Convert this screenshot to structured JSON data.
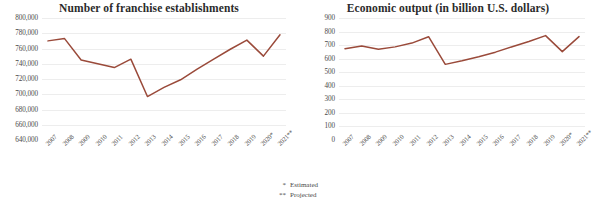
{
  "footnotes": [
    {
      "mark": "*",
      "label": "Estimated"
    },
    {
      "mark": "**",
      "label": "Projected"
    }
  ],
  "theme": {
    "line_color": "#9a4a3a",
    "grid_color": "#ededed",
    "text_color": "#4a4a4a",
    "background": "#ffffff"
  },
  "chart_data": [
    {
      "type": "line",
      "title": "Number of franchise establishments",
      "xlabel": "",
      "ylabel": "",
      "grid": true,
      "legend": "none",
      "ylim": [
        640000,
        800000
      ],
      "ytick_step": 20000,
      "yticks": [
        800000,
        780000,
        760000,
        740000,
        720000,
        700000,
        680000,
        660000,
        640000
      ],
      "ytick_labels": [
        "800,000",
        "780,000",
        "760,000",
        "740,000",
        "720,000",
        "700,000",
        "680,000",
        "660,000",
        "640,000"
      ],
      "categories": [
        "2007",
        "2008",
        "2009",
        "2010",
        "2011",
        "2012",
        "2013",
        "2014",
        "2015",
        "2016",
        "2017",
        "2018",
        "2019",
        "2020*",
        "2021**"
      ],
      "values": [
        770000,
        773000,
        745000,
        740000,
        735000,
        746000,
        697000,
        709000,
        719000,
        733000,
        746000,
        759000,
        771000,
        750000,
        778000
      ]
    },
    {
      "type": "line",
      "title": "Economic output (in billion U.S. dollars)",
      "xlabel": "",
      "ylabel": "",
      "grid": true,
      "legend": "none",
      "ylim": [
        0,
        900
      ],
      "ytick_step": 100,
      "yticks": [
        900,
        800,
        700,
        600,
        500,
        400,
        300,
        200,
        100,
        0
      ],
      "ytick_labels": [
        "900",
        "800",
        "700",
        "600",
        "500",
        "400",
        "300",
        "200",
        "100",
        "0"
      ],
      "categories": [
        "2007",
        "2008",
        "2009",
        "2010",
        "2011",
        "2012",
        "2013",
        "2014",
        "2015",
        "2016",
        "2017",
        "2018",
        "2019",
        "2020*",
        "2021**"
      ],
      "values": [
        674,
        694,
        670,
        687,
        715,
        762,
        558,
        584,
        614,
        648,
        688,
        727,
        770,
        652,
        763
      ]
    }
  ]
}
